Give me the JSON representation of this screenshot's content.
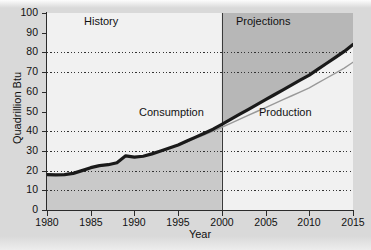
{
  "chart_data": {
    "type": "line",
    "title": "",
    "xlabel": "Year",
    "ylabel": "Quadrillion Btu",
    "xlim": [
      1980,
      2015
    ],
    "ylim": [
      0,
      100
    ],
    "xticks": [
      1980,
      1985,
      1990,
      1995,
      2000,
      2005,
      2010,
      2015
    ],
    "yticks": [
      0,
      10,
      20,
      30,
      40,
      50,
      60,
      70,
      80,
      90,
      100
    ],
    "gridlines_y": [
      10,
      20,
      30,
      40,
      70,
      80
    ],
    "grid": "horizontal-dotted",
    "legend": "none",
    "annotations": [
      {
        "text": "History",
        "x": 1989,
        "y": 97
      },
      {
        "text": "Projections",
        "x": 2007.5,
        "y": 97
      },
      {
        "text": "Consumption",
        "x": 1992.5,
        "y": 48
      },
      {
        "text": "Production",
        "x": 2006.5,
        "y": 48
      }
    ],
    "divider_x": 2000,
    "series": [
      {
        "name": "Consumption",
        "style": "thick-black",
        "color": "#1a1a1a",
        "x": [
          1980,
          1981,
          1982,
          1983,
          1984,
          1985,
          1986,
          1987,
          1988,
          1989,
          1990,
          1991,
          1992,
          1993,
          1994,
          1995,
          1996,
          1997,
          1998,
          1999,
          2000,
          2001,
          2002,
          2003,
          2004,
          2005,
          2006,
          2007,
          2008,
          2009,
          2010,
          2011,
          2012,
          2013,
          2014,
          2015
        ],
        "values": [
          18,
          17.8,
          18,
          18.6,
          20,
          21.5,
          22.5,
          23,
          24,
          27.5,
          26.8,
          27.3,
          28.5,
          30,
          31.5,
          33,
          35,
          37,
          39,
          41,
          43.5,
          46,
          48.5,
          51,
          53.5,
          56,
          58.5,
          61,
          63.5,
          66,
          68.5,
          71.5,
          74.5,
          77.5,
          80.5,
          84
        ]
      },
      {
        "name": "Production",
        "style": "thin-grey",
        "color": "#999999",
        "x": [
          1980,
          1981,
          1982,
          1983,
          1984,
          1985,
          1986,
          1987,
          1988,
          1989,
          1990,
          1991,
          1992,
          1993,
          1994,
          1995,
          1996,
          1997,
          1998,
          1999,
          2000,
          2001,
          2002,
          2003,
          2004,
          2005,
          2006,
          2007,
          2008,
          2009,
          2010,
          2011,
          2012,
          2013,
          2014,
          2015
        ],
        "values": [
          18,
          17.8,
          18,
          18.6,
          20,
          21.5,
          22.5,
          23,
          24,
          27.5,
          26.8,
          27.3,
          28.5,
          30,
          31.5,
          33,
          34.6,
          36.4,
          38.2,
          40,
          42,
          44,
          46,
          48,
          50,
          52,
          54,
          56,
          58,
          60,
          62,
          64.5,
          67,
          69.5,
          72,
          75
        ]
      }
    ],
    "regions": [
      {
        "name": "History",
        "x_from": 1980,
        "x_to": 2000,
        "fill_above_line": "#f1f1f1",
        "fill_below_line": "#c9c9c9"
      },
      {
        "name": "Projections",
        "x_from": 2000,
        "x_to": 2015,
        "fill_above_line": "#b7b7b7",
        "fill_below_line": "#f1f1f1"
      }
    ]
  }
}
